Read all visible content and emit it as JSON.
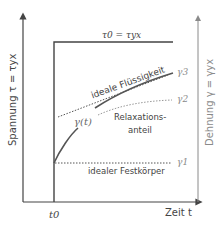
{
  "axes": {
    "left_label": "Spannung τ = τyx",
    "right_label": "Dehnung γ = γyx",
    "x_label": "Zeit t",
    "x_tick": "t0"
  },
  "annotations": {
    "stress_level": "τ0 = τyx",
    "ideal_fluid": "ideale Flüssigkeit",
    "relaxation_line1": "Relaxations-",
    "relaxation_line2": "anteil",
    "ideal_solid": "idealer Festkörper",
    "curve_label": "γ(t)",
    "gamma1": "γ1",
    "gamma2": "γ2",
    "gamma3": "γ3"
  },
  "colors": {
    "stress_axis": "#444444",
    "strain_axis": "#8a8a8a",
    "curve": "#555555"
  }
}
